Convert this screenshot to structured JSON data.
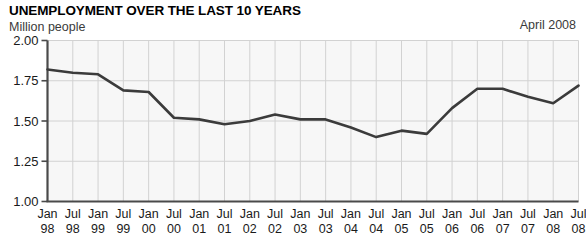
{
  "chart_data": {
    "type": "line",
    "title": "UNEMPLOYMENT OVER THE LAST 10 YEARS",
    "subtitle": "Million people",
    "annotation": "April 2008",
    "xlabel": "",
    "ylabel": "Million people",
    "ylim": [
      1.0,
      2.0
    ],
    "ytick_labels": [
      "2.00",
      "1.75",
      "1.50",
      "1.25",
      "1.00"
    ],
    "ytick_values": [
      2.0,
      1.75,
      1.5,
      1.25,
      1.0
    ],
    "grid": true,
    "legend": false,
    "line_color": "#3b3b3b",
    "plot_bg": "#f7f7f7",
    "grid_color": "#d2d2d2",
    "axis_color": "#555555",
    "categories": [
      "Jan 98",
      "Jul 98",
      "Jan 99",
      "Jul 99",
      "Jan 00",
      "Jul 00",
      "Jan 01",
      "Jul 01",
      "Jan 02",
      "Jul 02",
      "Jan 03",
      "Jul 03",
      "Jan 04",
      "Jul 04",
      "Jan 05",
      "Jul 05",
      "Jan 06",
      "Jul 06",
      "Jan 07",
      "Jul 07",
      "Jan 08",
      "Jul 08"
    ],
    "xtick_months": [
      "Jan",
      "Jul",
      "Jan",
      "Jul",
      "Jan",
      "Jul",
      "Jan",
      "Jul",
      "Jan",
      "Jul",
      "Jan",
      "Jul",
      "Jan",
      "Jul",
      "Jan",
      "Jul",
      "Jan",
      "Jul",
      "Jan",
      "Jul",
      "Jan",
      "Jul"
    ],
    "xtick_years": [
      "98",
      "98",
      "99",
      "99",
      "00",
      "00",
      "01",
      "01",
      "02",
      "02",
      "03",
      "03",
      "04",
      "04",
      "05",
      "05",
      "06",
      "06",
      "07",
      "07",
      "08",
      "08"
    ],
    "values": [
      1.82,
      1.8,
      1.79,
      1.69,
      1.68,
      1.52,
      1.51,
      1.48,
      1.5,
      1.54,
      1.51,
      1.51,
      1.46,
      1.4,
      1.44,
      1.42,
      1.58,
      1.7,
      1.7,
      1.65,
      1.61,
      1.72
    ]
  }
}
